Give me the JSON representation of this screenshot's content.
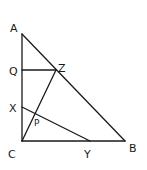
{
  "diagram": {
    "type": "geometry-figure",
    "points": {
      "A": {
        "label": "A"
      },
      "B": {
        "label": "B"
      },
      "C": {
        "label": "C"
      },
      "Q": {
        "label": "Q"
      },
      "Z": {
        "label": "Z"
      },
      "X": {
        "label": "X"
      },
      "Y": {
        "label": "Y"
      },
      "P": {
        "label": "P"
      }
    },
    "segments": [
      [
        "A",
        "C"
      ],
      [
        "C",
        "B"
      ],
      [
        "A",
        "B"
      ],
      [
        "Q",
        "Z"
      ],
      [
        "C",
        "Z"
      ],
      [
        "X",
        "Y"
      ]
    ]
  }
}
